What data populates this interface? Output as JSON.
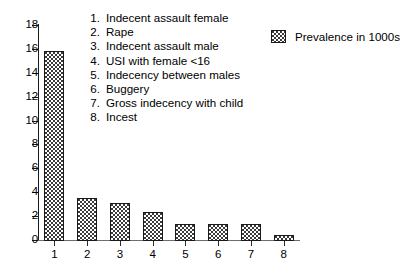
{
  "chart_data": {
    "type": "bar",
    "title": "",
    "subtitle": "",
    "xlabel": "",
    "ylabel": "",
    "categories": [
      "1",
      "2",
      "3",
      "4",
      "5",
      "6",
      "7",
      "8"
    ],
    "values": [
      15.9,
      3.6,
      3.2,
      2.4,
      1.4,
      1.4,
      1.4,
      0.5
    ],
    "series": [
      {
        "name": "Prevalence in 1000s",
        "values": [
          15.9,
          3.6,
          3.2,
          2.4,
          1.4,
          1.4,
          1.4,
          0.5
        ]
      }
    ],
    "ylim": [
      0,
      18
    ],
    "ytick_labels": [
      "0",
      "2",
      "4",
      "6",
      "8",
      "10",
      "12",
      "14",
      "16",
      "18"
    ],
    "ytick_values": [
      0,
      2,
      4,
      6,
      8,
      10,
      12,
      14,
      16,
      18
    ],
    "xtick_labels": [
      "1",
      "2",
      "3",
      "4",
      "5",
      "6",
      "7",
      "8"
    ],
    "grid": false,
    "legend_position": "top-right",
    "bar_fill": "dotted-checker-pattern",
    "colors": {
      "axis": "#1a1a1a",
      "bar_outline": "#1a1a1a",
      "bar_fill": "#ffffff",
      "bar_pattern_dot": "#3a3a3a",
      "background": "#ffffff",
      "text": "#000000"
    }
  },
  "series_key": {
    "label": "Prevalence in 1000s",
    "swatch_name": "pattern-swatch"
  },
  "category_legend": {
    "items": [
      {
        "num": "1.",
        "label": "Indecent assault female"
      },
      {
        "num": "2.",
        "label": "Rape"
      },
      {
        "num": "3.",
        "label": "Indecent assault male"
      },
      {
        "num": "4.",
        "label": "USI with female <16"
      },
      {
        "num": "5.",
        "label": "Indecency between males"
      },
      {
        "num": "6.",
        "label": "Buggery"
      },
      {
        "num": "7.",
        "label": "Gross indecency with child"
      },
      {
        "num": "8.",
        "label": "Incest"
      }
    ]
  }
}
